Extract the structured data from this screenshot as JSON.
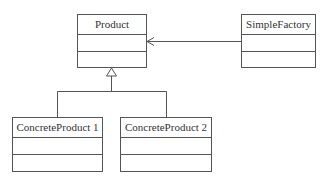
{
  "diagram": {
    "type": "uml-class-diagram",
    "classes": [
      {
        "id": "product",
        "name": "Product",
        "attributes": [],
        "operations": []
      },
      {
        "id": "simple-factory",
        "name": "SimpleFactory",
        "attributes": [],
        "operations": []
      },
      {
        "id": "concrete-product-1",
        "name": "ConcreteProduct 1",
        "attributes": [],
        "operations": []
      },
      {
        "id": "concrete-product-2",
        "name": "ConcreteProduct 2",
        "attributes": [],
        "operations": []
      }
    ],
    "relationships": [
      {
        "type": "dependency",
        "from": "SimpleFactory",
        "to": "Product"
      },
      {
        "type": "generalization",
        "from": "ConcreteProduct 1",
        "to": "Product"
      },
      {
        "type": "generalization",
        "from": "ConcreteProduct 2",
        "to": "Product"
      }
    ],
    "colors": {
      "line": "#555555",
      "text": "#333333",
      "background": "#ffffff"
    }
  }
}
